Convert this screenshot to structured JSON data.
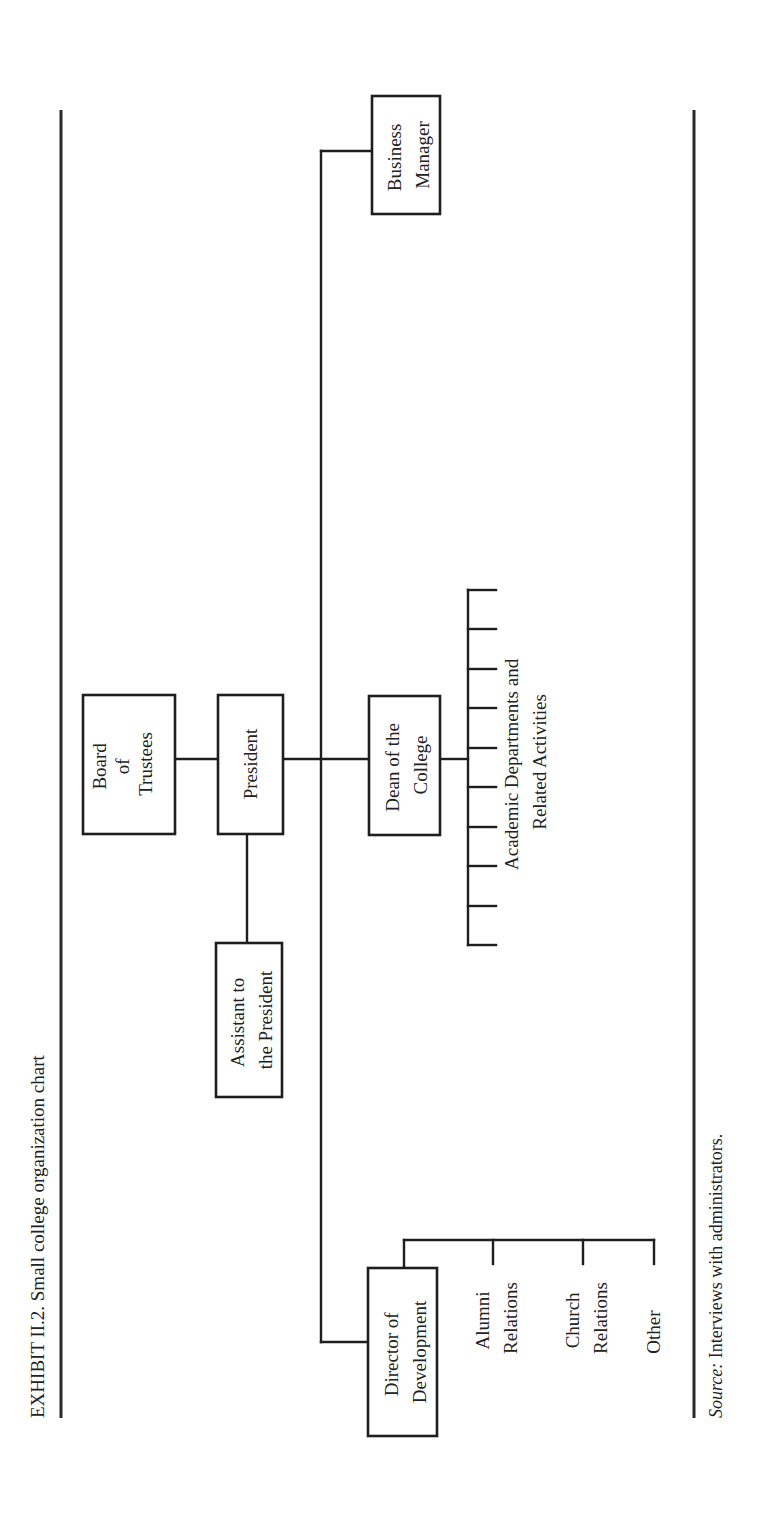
{
  "exhibit": {
    "title": "EXHIBIT II.2. Small college organization chart",
    "source_label": "Source:",
    "source_text": " Interviews with administrators."
  },
  "nodes": {
    "board": {
      "lines": [
        "Board",
        "of",
        "Trustees"
      ]
    },
    "president": {
      "lines": [
        "President"
      ]
    },
    "assistant": {
      "lines": [
        "Assistant to",
        "the President"
      ]
    },
    "business_manager": {
      "lines": [
        "Business",
        "Manager"
      ]
    },
    "dean": {
      "lines": [
        "Dean of the",
        "College"
      ]
    },
    "academic": {
      "lines": [
        "Academic Departments and",
        "Related Activities"
      ],
      "tick_count": 10
    },
    "director": {
      "lines": [
        "Director of",
        "Development"
      ]
    },
    "alumni": {
      "lines": [
        "Alumni",
        "Relations"
      ]
    },
    "church": {
      "lines": [
        "Church",
        "Relations"
      ]
    },
    "other": {
      "lines": [
        "Other"
      ]
    }
  },
  "colors": {
    "ink": "#1e1e1e",
    "paper": "#ffffff"
  }
}
